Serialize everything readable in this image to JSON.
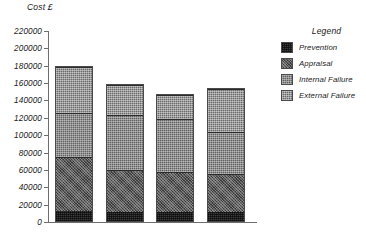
{
  "chart_data": {
    "type": "bar",
    "stacked": true,
    "title": "",
    "xlabel": "",
    "ylabel": "Cost £",
    "ylim": [
      0,
      220000
    ],
    "ytick_step": 20000,
    "yticks": [
      0,
      20000,
      40000,
      60000,
      80000,
      100000,
      120000,
      140000,
      160000,
      180000,
      200000,
      220000
    ],
    "ytick_labels": [
      "0",
      "20000",
      "40000",
      "60000",
      "80000",
      "100000",
      "120000",
      "140000",
      "160000",
      "180000",
      "200000",
      "220000"
    ],
    "grid": false,
    "legend_position": "right",
    "legend_title": "Legend",
    "categories": [
      "Jan/Mar",
      "Apr/Jun",
      "Jul/Sep",
      "Oct/Dec"
    ],
    "series": [
      {
        "name": "Prevention",
        "color": "#3a3a3a",
        "values": [
          11000,
          10000,
          10000,
          10000
        ]
      },
      {
        "name": "Appraisal",
        "color": "#585858",
        "values": [
          63000,
          49000,
          47000,
          44000
        ]
      },
      {
        "name": "Internal Failure",
        "color": "#616161",
        "values": [
          51000,
          63000,
          61000,
          48000
        ]
      },
      {
        "name": "External Failure",
        "color": "#686868",
        "values": [
          52000,
          35000,
          27000,
          50000
        ]
      }
    ],
    "totals": [
      177000,
      157000,
      145000,
      152000
    ],
    "annotations": []
  },
  "axis": {
    "y_title": "Cost £"
  },
  "legend": {
    "title": "Legend",
    "items": [
      {
        "label": "Prevention"
      },
      {
        "label": "Appraisal"
      },
      {
        "label": "Internal Failure"
      },
      {
        "label": "External Failure"
      }
    ]
  }
}
